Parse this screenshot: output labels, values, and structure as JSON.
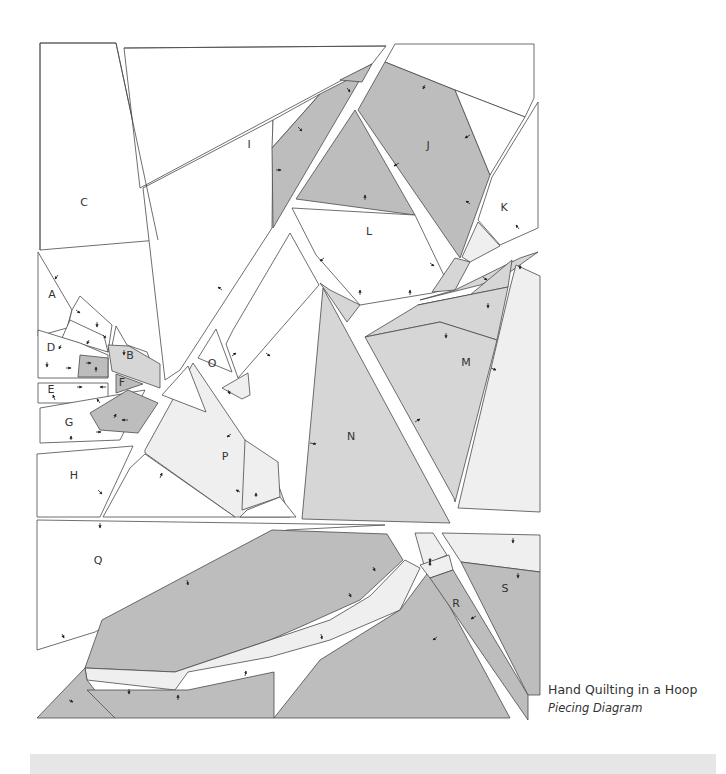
{
  "caption": {
    "title": "Hand Quilting in a Hoop",
    "subtitle": "Piecing Diagram"
  },
  "colors": {
    "white": "#ffffff",
    "light": "#efefef",
    "medium": "#d6d6d6",
    "dark": "#bdbdbd",
    "stroke": "#4a4a4a",
    "footer": "#e6e6e6"
  },
  "labels": [
    {
      "id": "A",
      "x": 52,
      "y": 295
    },
    {
      "id": "B",
      "x": 130,
      "y": 356
    },
    {
      "id": "C",
      "x": 84,
      "y": 203
    },
    {
      "id": "D",
      "x": 51,
      "y": 348
    },
    {
      "id": "E",
      "x": 51,
      "y": 390
    },
    {
      "id": "F",
      "x": 122,
      "y": 383
    },
    {
      "id": "G",
      "x": 69,
      "y": 423
    },
    {
      "id": "H",
      "x": 74,
      "y": 476
    },
    {
      "id": "I",
      "x": 249,
      "y": 145
    },
    {
      "id": "J",
      "x": 428,
      "y": 146
    },
    {
      "id": "K",
      "x": 504,
      "y": 208
    },
    {
      "id": "L",
      "x": 369,
      "y": 232
    },
    {
      "id": "M",
      "x": 466,
      "y": 363
    },
    {
      "id": "N",
      "x": 351,
      "y": 437
    },
    {
      "id": "O",
      "x": 212,
      "y": 364
    },
    {
      "id": "P",
      "x": 225,
      "y": 457
    },
    {
      "id": "Q",
      "x": 98,
      "y": 561
    },
    {
      "id": "R",
      "x": 456,
      "y": 604
    },
    {
      "id": "S",
      "x": 505,
      "y": 589
    }
  ],
  "pieces": [
    {
      "name": "C",
      "fill": "white",
      "pts": "40,43 116,43 158,240 40,250"
    },
    {
      "name": "I-top",
      "fill": "white",
      "pts": "124,48 386,46 372,64 140,188"
    },
    {
      "name": "I-left",
      "fill": "white",
      "pts": "143,188 273,120 272,228 180,370 165,380"
    },
    {
      "name": "I-white-wedge",
      "fill": "white",
      "pts": "273,120 320,94 272,148"
    },
    {
      "name": "I-dark-strip",
      "fill": "dark",
      "pts": "320,94 365,71 273,228 272,148"
    },
    {
      "name": "I-dark-top",
      "fill": "dark",
      "pts": "340,80 372,64 362,82"
    },
    {
      "name": "J-white-top",
      "fill": "white",
      "pts": "395,44 534,44 534,98 525,117 455,90 385,62"
    },
    {
      "name": "J-dark",
      "fill": "dark",
      "pts": "385,62 455,90 490,175 460,258 358,110"
    },
    {
      "name": "J-white-right",
      "fill": "white",
      "pts": "455,90 525,117 490,175"
    },
    {
      "name": "K",
      "fill": "white",
      "pts": "538,102 538,228 500,245 478,220 492,177"
    },
    {
      "name": "K-light",
      "fill": "light",
      "pts": "478,222 500,246 470,262 462,257"
    },
    {
      "name": "L-dark",
      "fill": "dark",
      "pts": "355,110 415,215 296,199"
    },
    {
      "name": "L-white",
      "fill": "white",
      "pts": "292,208 415,215 450,288 432,293 360,305 316,255"
    },
    {
      "name": "L-light-strip",
      "fill": "medium",
      "pts": "432,292 455,258 470,262 455,290"
    },
    {
      "name": "N-small-left",
      "fill": "medium",
      "pts": "320,283 330,290 360,305 347,322 332,300"
    },
    {
      "name": "M-strip",
      "fill": "medium",
      "pts": "455,290 520,258 538,252 510,272 480,285 420,300"
    },
    {
      "name": "M-upper-dark",
      "fill": "medium",
      "pts": "470,295 512,260 508,287 418,305"
    },
    {
      "name": "M-mid",
      "fill": "medium",
      "pts": "365,337 418,305 508,287 497,340 440,322"
    },
    {
      "name": "M-main",
      "fill": "medium",
      "pts": "365,337 440,322 497,340 455,502 454,498"
    },
    {
      "name": "M-right-light",
      "fill": "light",
      "pts": "516,265 540,276 540,512 458,508 510,288"
    },
    {
      "name": "N",
      "fill": "medium",
      "pts": "323,288 450,523 302,519"
    },
    {
      "name": "long-white-strip",
      "fill": "white",
      "pts": "290,233 319,285 238,378 226,344 233,330"
    },
    {
      "name": "O-triangle",
      "fill": "white",
      "pts": "216,329 232,372 198,358"
    },
    {
      "name": "O-strip-light",
      "fill": "light",
      "pts": "222,388 248,373 250,395 242,399"
    },
    {
      "name": "P-light",
      "fill": "light",
      "pts": "193,363 245,440 274,473 290,517 235,517 145,453 145,450"
    },
    {
      "name": "P-right-light",
      "fill": "light",
      "pts": "245,440 278,462 280,497 242,510"
    },
    {
      "name": "P-bottom-white",
      "fill": "white",
      "pts": "130,468 145,454 235,517 103,517"
    },
    {
      "name": "P-bottom-right",
      "fill": "white",
      "pts": "247,510 280,497 296,517 240,517"
    },
    {
      "name": "O-tri-left",
      "fill": "white",
      "pts": "188,366 206,412 162,395"
    },
    {
      "name": "A",
      "fill": "white",
      "pts": "38,252 38,336 67,328 72,310"
    },
    {
      "name": "A-mid",
      "fill": "white",
      "pts": "72,310 67,330 108,352 112,325 80,296"
    },
    {
      "name": "A-right",
      "fill": "white",
      "pts": "62,338 108,352 104,336 70,320"
    },
    {
      "name": "B-white",
      "fill": "white",
      "pts": "116,326 127,345 147,352 156,376 112,346"
    },
    {
      "name": "B-dark",
      "fill": "medium",
      "pts": "108,345 129,346 160,364 160,388 112,371"
    },
    {
      "name": "D-white",
      "fill": "white",
      "pts": "38,330 80,343 108,355 108,378 38,378"
    },
    {
      "name": "D-dark",
      "fill": "dark",
      "pts": "80,355 108,358 108,377 78,377"
    },
    {
      "name": "E",
      "fill": "white",
      "pts": "38,383 108,383 108,403 38,403"
    },
    {
      "name": "F",
      "fill": "dark",
      "pts": "116,374 143,384 116,393"
    },
    {
      "name": "G",
      "fill": "white",
      "pts": "40,408 145,390 120,440 40,443"
    },
    {
      "name": "G-dark",
      "fill": "dark",
      "pts": "90,413 128,390 158,403 138,433 100,430"
    },
    {
      "name": "H",
      "fill": "white",
      "pts": "37,454 133,446 100,517 37,517"
    },
    {
      "name": "Q-white",
      "fill": "white",
      "pts": "37,520 385,525 287,530 230,560 95,632 37,650"
    },
    {
      "name": "Q-big-dark",
      "fill": "dark",
      "pts": "102,620 272,530 387,534 403,560 360,600 300,627 270,640 175,672 85,668"
    },
    {
      "name": "Q-light-strip-long",
      "fill": "light",
      "pts": "405,560 420,568 400,610 330,640 270,657 188,672 175,690 87,680 85,668 175,672 270,640 330,620 370,596"
    },
    {
      "name": "Q-left-dark",
      "fill": "dark",
      "pts": "37,718 85,668 87,680 115,716 115,718"
    },
    {
      "name": "Q-bottom-dark",
      "fill": "dark",
      "pts": "87,690 188,690 274,672 274,718 115,718"
    },
    {
      "name": "Q-right-dark",
      "fill": "dark",
      "pts": "400,610 430,570 510,718 274,718 320,660"
    },
    {
      "name": "R-light",
      "fill": "light",
      "pts": "415,533 433,533 447,555 424,565"
    },
    {
      "name": "R-light-2",
      "fill": "light",
      "pts": "420,565 449,555 453,570 430,578"
    },
    {
      "name": "R-dark",
      "fill": "dark",
      "pts": "430,578 453,570 528,695 528,720"
    },
    {
      "name": "S-light",
      "fill": "light",
      "pts": "442,533 540,535 540,572 461,562"
    },
    {
      "name": "S-dark",
      "fill": "dark",
      "pts": "461,562 540,572 540,695 528,695"
    }
  ],
  "seams": [
    "124,48 386,46",
    "40,43 116,43",
    "40,43 40,250",
    "116,43 158,240"
  ],
  "arrows": [
    {
      "x": 347,
      "y": 88,
      "dx": 3,
      "dy": 4
    },
    {
      "x": 298,
      "y": 127,
      "dx": 4,
      "dy": 4
    },
    {
      "x": 276,
      "y": 170,
      "dx": 5,
      "dy": 0
    },
    {
      "x": 425,
      "y": 85,
      "dx": -2,
      "dy": 4
    },
    {
      "x": 470,
      "y": 135,
      "dx": -5,
      "dy": 3
    },
    {
      "x": 399,
      "y": 163,
      "dx": -5,
      "dy": 3
    },
    {
      "x": 470,
      "y": 204,
      "dx": -4,
      "dy": -3
    },
    {
      "x": 519,
      "y": 229,
      "dx": -3,
      "dy": -4
    },
    {
      "x": 365,
      "y": 200,
      "dx": 0,
      "dy": -5
    },
    {
      "x": 324,
      "y": 258,
      "dx": -4,
      "dy": 3
    },
    {
      "x": 430,
      "y": 263,
      "dx": 4,
      "dy": 3
    },
    {
      "x": 360,
      "y": 295,
      "dx": 0,
      "dy": -5
    },
    {
      "x": 410,
      "y": 295,
      "dx": 0,
      "dy": -5
    },
    {
      "x": 520,
      "y": 265,
      "dx": 0,
      "dy": 4
    },
    {
      "x": 483,
      "y": 277,
      "dx": 4,
      "dy": 3
    },
    {
      "x": 488,
      "y": 303,
      "dx": 0,
      "dy": 5
    },
    {
      "x": 446,
      "y": 333,
      "dx": 0,
      "dy": 5
    },
    {
      "x": 491,
      "y": 368,
      "dx": 5,
      "dy": 2
    },
    {
      "x": 415,
      "y": 422,
      "dx": 5,
      "dy": -3
    },
    {
      "x": 310,
      "y": 443,
      "dx": 6,
      "dy": 1
    },
    {
      "x": 222,
      "y": 290,
      "dx": -4,
      "dy": -3
    },
    {
      "x": 232,
      "y": 356,
      "dx": 4,
      "dy": -3
    },
    {
      "x": 266,
      "y": 353,
      "dx": 4,
      "dy": 3
    },
    {
      "x": 228,
      "y": 390,
      "dx": 2,
      "dy": 4
    },
    {
      "x": 231,
      "y": 434,
      "dx": -4,
      "dy": 3
    },
    {
      "x": 160,
      "y": 478,
      "dx": 2,
      "dy": -5
    },
    {
      "x": 240,
      "y": 492,
      "dx": -4,
      "dy": -2
    },
    {
      "x": 256,
      "y": 497,
      "dx": 0,
      "dy": -4
    },
    {
      "x": 98,
      "y": 490,
      "dx": 4,
      "dy": 4
    },
    {
      "x": 58,
      "y": 275,
      "dx": -3,
      "dy": 4
    },
    {
      "x": 76,
      "y": 310,
      "dx": 4,
      "dy": 3
    },
    {
      "x": 97,
      "y": 322,
      "dx": 0,
      "dy": 5
    },
    {
      "x": 103,
      "y": 335,
      "dx": 3,
      "dy": 3
    },
    {
      "x": 89,
      "y": 340,
      "dx": -2,
      "dy": 4
    },
    {
      "x": 124,
      "y": 350,
      "dx": 0,
      "dy": 5
    },
    {
      "x": 61,
      "y": 345,
      "dx": -2,
      "dy": 4
    },
    {
      "x": 47,
      "y": 362,
      "dx": 0,
      "dy": 5
    },
    {
      "x": 66,
      "y": 368,
      "dx": 5,
      "dy": 0
    },
    {
      "x": 86,
      "y": 363,
      "dx": 5,
      "dy": 0
    },
    {
      "x": 96,
      "y": 372,
      "dx": 0,
      "dy": -5
    },
    {
      "x": 55,
      "y": 400,
      "dx": -2,
      "dy": -5
    },
    {
      "x": 77,
      "y": 387,
      "dx": 5,
      "dy": 0
    },
    {
      "x": 106,
      "y": 387,
      "dx": -6,
      "dy": 0
    },
    {
      "x": 100,
      "y": 403,
      "dx": -3,
      "dy": -4
    },
    {
      "x": 114,
      "y": 418,
      "dx": 2,
      "dy": -4
    },
    {
      "x": 128,
      "y": 420,
      "dx": -6,
      "dy": 0
    },
    {
      "x": 96,
      "y": 432,
      "dx": 5,
      "dy": 0
    },
    {
      "x": 71,
      "y": 440,
      "dx": 0,
      "dy": -4
    },
    {
      "x": 100,
      "y": 523,
      "dx": 0,
      "dy": 5
    },
    {
      "x": 187,
      "y": 580,
      "dx": 1,
      "dy": 5
    },
    {
      "x": 373,
      "y": 567,
      "dx": 2,
      "dy": 4
    },
    {
      "x": 349,
      "y": 593,
      "dx": 2,
      "dy": 4
    },
    {
      "x": 321,
      "y": 634,
      "dx": 1,
      "dy": 5
    },
    {
      "x": 245,
      "y": 676,
      "dx": 1,
      "dy": -5
    },
    {
      "x": 129,
      "y": 689,
      "dx": 0,
      "dy": 5
    },
    {
      "x": 178,
      "y": 700,
      "dx": 0,
      "dy": -5
    },
    {
      "x": 62,
      "y": 634,
      "dx": 2,
      "dy": 4
    },
    {
      "x": 69,
      "y": 700,
      "dx": 4,
      "dy": 2
    },
    {
      "x": 430,
      "y": 558,
      "dx": 0,
      "dy": 4
    },
    {
      "x": 430,
      "y": 566,
      "dx": 0,
      "dy": -4
    },
    {
      "x": 513,
      "y": 538,
      "dx": 0,
      "dy": 5
    },
    {
      "x": 518,
      "y": 573,
      "dx": 0,
      "dy": 5
    },
    {
      "x": 476,
      "y": 616,
      "dx": -5,
      "dy": 3
    },
    {
      "x": 437,
      "y": 637,
      "dx": -4,
      "dy": 3
    }
  ]
}
